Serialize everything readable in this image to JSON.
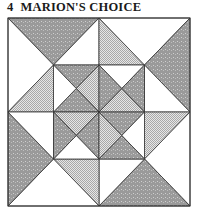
{
  "title": {
    "number": "4",
    "name": "MARION'S CHOICE"
  },
  "colors": {
    "dark": "#9a9a9a",
    "checker": "#d2d2d2",
    "white": "#ffffff",
    "line": "#333333"
  },
  "quilt": {
    "bounds": {
      "left": 8,
      "top": 18,
      "right": 190,
      "bottom": 206
    },
    "grid": {
      "cols": 4,
      "rows": 4
    },
    "fabrics": [
      "dark-speckled",
      "light-checkered",
      "white"
    ],
    "pieces": [
      {
        "fill": "dark",
        "pts": "L,T m,T a,c"
      },
      {
        "fill": "white",
        "pts": "L,T a,c L,n"
      },
      {
        "fill": "checker",
        "pts": "L,n a,c a,n"
      },
      {
        "fill": "white",
        "pts": "a,c m,T m,c"
      },
      {
        "fill": "checker",
        "pts": "m,T m,c b,c"
      },
      {
        "fill": "white",
        "pts": "m,T R,T b,c"
      },
      {
        "fill": "dark",
        "pts": "R,T b,c R,n"
      },
      {
        "fill": "white",
        "pts": "b,c b,n R,n"
      },
      {
        "fill": "checker",
        "pts": "b,n R,n b,d"
      },
      {
        "fill": "white",
        "pts": "R,n b,d R,B"
      },
      {
        "fill": "dark",
        "pts": "m,B b,d R,B"
      },
      {
        "fill": "white",
        "pts": "m,d b,d m,B"
      },
      {
        "fill": "checker",
        "pts": "a,d m,d m,B"
      },
      {
        "fill": "white",
        "pts": "L,B a,d m,B"
      },
      {
        "fill": "dark",
        "pts": "L,n a,d L,B"
      },
      {
        "fill": "white",
        "pts": "L,n a,n a,d"
      },
      {
        "fill": "dark",
        "pts": "a,c m,c q1x,q1y"
      },
      {
        "fill": "checker",
        "pts": "m,c m,n q1x,q1y"
      },
      {
        "fill": "dark",
        "pts": "a,n m,n q1x,q1y"
      },
      {
        "fill": "white",
        "pts": "a,c a,n q1x,q1y"
      },
      {
        "fill": "white",
        "pts": "m,c b,c q2x,q1y"
      },
      {
        "fill": "dark",
        "pts": "b,c b,n q2x,q1y"
      },
      {
        "fill": "checker",
        "pts": "m,n b,n q2x,q1y"
      },
      {
        "fill": "dark",
        "pts": "m,c m,n q2x,q1y"
      },
      {
        "fill": "checker",
        "pts": "a,n m,n q1x,q3y"
      },
      {
        "fill": "dark",
        "pts": "m,n m,d q1x,q3y"
      },
      {
        "fill": "white",
        "pts": "a,d m,d q1x,q3y"
      },
      {
        "fill": "dark",
        "pts": "a,n a,d q1x,q3y"
      },
      {
        "fill": "dark",
        "pts": "m,n b,n q2x,q3y"
      },
      {
        "fill": "white",
        "pts": "b,n b,d q2x,q3y"
      },
      {
        "fill": "dark",
        "pts": "m,d b,d q2x,q3y"
      },
      {
        "fill": "checker",
        "pts": "m,n m,d q2x,q3y"
      }
    ]
  }
}
